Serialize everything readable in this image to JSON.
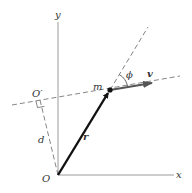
{
  "diagram": {
    "axes": {
      "x_label": "x",
      "y_label": "y",
      "origin_label": "O"
    },
    "points": {
      "particle_label": "m",
      "foot_label": "O′"
    },
    "vectors": {
      "position_label": "r",
      "velocity_label": "v"
    },
    "measures": {
      "distance_label": "d",
      "angle_label": "ϕ"
    },
    "colors": {
      "axis": "#9a9a9a",
      "vector_r": "#111111",
      "vector_v": "#555555",
      "dashed": "#666666",
      "text": "#333333"
    }
  }
}
